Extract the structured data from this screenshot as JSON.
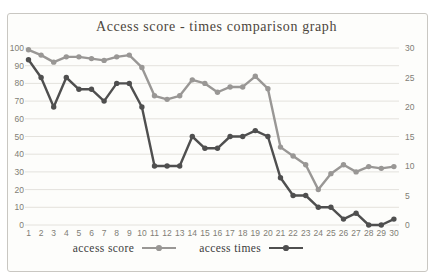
{
  "chart": {
    "title": "Access score - times comparison graph",
    "legend": [
      {
        "label": "access score",
        "color": "#999795"
      },
      {
        "label": "access times",
        "color": "#4f4f4f"
      }
    ]
  },
  "chart_data": {
    "type": "line",
    "title": "Access score - times comparison graph",
    "x": [
      1,
      2,
      3,
      4,
      5,
      6,
      7,
      8,
      9,
      10,
      11,
      12,
      13,
      14,
      15,
      16,
      17,
      18,
      19,
      20,
      21,
      22,
      23,
      24,
      25,
      26,
      27,
      28,
      29,
      30
    ],
    "series": [
      {
        "name": "access score",
        "axis": "left",
        "color": "#999795",
        "values": [
          99,
          96,
          92,
          95,
          95,
          94,
          93,
          95,
          96,
          89,
          73,
          71,
          73,
          82,
          80,
          75,
          78,
          78,
          84,
          77,
          44,
          39,
          34,
          20,
          29,
          34,
          30,
          33,
          32,
          33
        ]
      },
      {
        "name": "access times",
        "axis": "right",
        "color": "#4f4f4f",
        "values": [
          28,
          25,
          20,
          25,
          23,
          23,
          21,
          24,
          24,
          20,
          10,
          10,
          10,
          15,
          13,
          13,
          15,
          15,
          16,
          15,
          8,
          5,
          5,
          3,
          3,
          1,
          2,
          0,
          0,
          1
        ]
      }
    ],
    "left_axis": {
      "min": 0,
      "max": 100,
      "step": 10,
      "ticks": [
        0,
        10,
        20,
        30,
        40,
        50,
        60,
        70,
        80,
        90,
        100
      ]
    },
    "right_axis": {
      "min": 0,
      "max": 30,
      "step": 5,
      "ticks": [
        0,
        5,
        10,
        15,
        20,
        25,
        30
      ]
    },
    "grid": true,
    "grid_color": "#e4e2dd",
    "legend_position": "bottom"
  }
}
